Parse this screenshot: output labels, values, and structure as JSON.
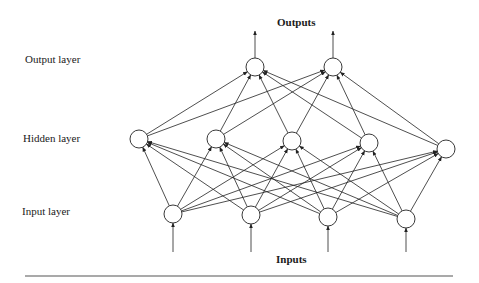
{
  "diagram": {
    "title_top": "Outputs",
    "title_bottom": "Inputs",
    "layer_labels": {
      "output": "Output layer",
      "hidden": "Hidden layer",
      "input": "Input layer"
    },
    "layers": {
      "output": [
        [
          255,
          67
        ],
        [
          333,
          67
        ]
      ],
      "hidden": [
        [
          139,
          139
        ],
        [
          216,
          139
        ],
        [
          292,
          141
        ],
        [
          369,
          143
        ],
        [
          446,
          149
        ]
      ],
      "input": [
        [
          173,
          214
        ],
        [
          251,
          215
        ],
        [
          328,
          217
        ],
        [
          406,
          219
        ]
      ]
    },
    "node_radius": 9,
    "connectivity": "fully-connected feedforward (input→hidden→output)",
    "colors": {
      "stroke": "#222222",
      "background": "#ffffff",
      "rule": "#555555"
    }
  }
}
